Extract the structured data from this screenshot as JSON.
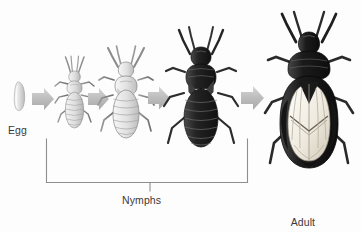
{
  "figure": {
    "title_implicit": "Chinch bug life cycle",
    "background_color": "#fdfdfd",
    "text_color": "#3a3a3a",
    "arrow_color": "#b9b9b9",
    "bracket_color": "#8e8e8e"
  },
  "labels": {
    "egg": "Egg",
    "nymphs": "Nymphs",
    "adult_line1": "Adult",
    "adult_line2": "chinch bug"
  },
  "stages": [
    {
      "name": "egg",
      "label": "Egg",
      "order": 1,
      "body_color": "#d9d9d9"
    },
    {
      "name": "nymph-1",
      "label": "",
      "order": 2,
      "body_color": "#cfcfcf"
    },
    {
      "name": "nymph-2",
      "label": "",
      "order": 3,
      "body_color": "#d8d8d8"
    },
    {
      "name": "nymph-3",
      "label": "",
      "order": 4,
      "body_color": "#2a2a2a"
    },
    {
      "name": "adult",
      "label": "Adult chinch bug",
      "order": 5,
      "body_color": "#1e1e1e",
      "wing_color": "#f2efe8"
    }
  ],
  "arrows": [
    {
      "name": "arrow-egg-to-nymph1",
      "from": "egg",
      "to": "nymph-1"
    },
    {
      "name": "arrow-nymph1-to-nymph2",
      "from": "nymph-1",
      "to": "nymph-2"
    },
    {
      "name": "arrow-nymph2-to-nymph3",
      "from": "nymph-2",
      "to": "nymph-3"
    },
    {
      "name": "arrow-nymph3-to-adult",
      "from": "nymph-3",
      "to": "adult"
    }
  ],
  "bracket": {
    "name": "nymphs-bracket",
    "spans_stages": [
      "nymph-1",
      "nymph-2",
      "nymph-3"
    ],
    "label": "Nymphs"
  }
}
